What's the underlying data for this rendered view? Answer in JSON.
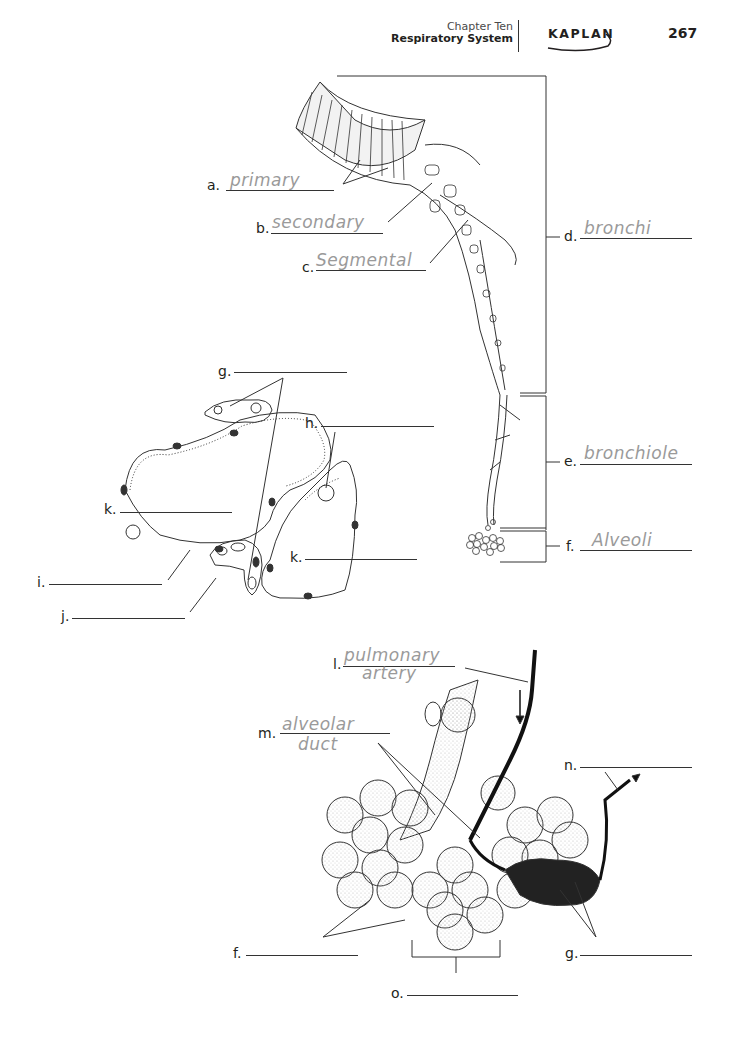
{
  "header": {
    "chapter": "Chapter Ten",
    "section": "Respiratory System",
    "brand": "KAPLAN",
    "page_number": "267"
  },
  "figure1": {
    "title": "Bronchial tree",
    "labels": [
      {
        "letter": "a.",
        "answer": "primary"
      },
      {
        "letter": "b.",
        "answer": "secondary"
      },
      {
        "letter": "c.",
        "answer": "Segmental"
      },
      {
        "letter": "d.",
        "answer": "bronchi"
      },
      {
        "letter": "e.",
        "answer": "bronchiole"
      },
      {
        "letter": "f.",
        "answer": "Alveoli"
      }
    ]
  },
  "figure2": {
    "title": "Alveolar cross section",
    "labels": [
      {
        "letter": "g.",
        "answer": ""
      },
      {
        "letter": "h.",
        "answer": ""
      },
      {
        "letter": "k.",
        "answer": ""
      },
      {
        "letter": "k.",
        "answer": ""
      },
      {
        "letter": "i.",
        "answer": ""
      },
      {
        "letter": "j.",
        "answer": ""
      }
    ]
  },
  "figure3": {
    "title": "Alveolar sacs with pulmonary vessels",
    "labels": [
      {
        "letter": "l.",
        "answer_line1": "pulmonary",
        "answer_line2": "artery"
      },
      {
        "letter": "m.",
        "answer_line1": "alveolar",
        "answer_line2": "duct"
      },
      {
        "letter": "n.",
        "answer": ""
      },
      {
        "letter": "f.",
        "answer": ""
      },
      {
        "letter": "g.",
        "answer": ""
      },
      {
        "letter": "o.",
        "answer": ""
      }
    ]
  },
  "colors": {
    "ink": "#231f20",
    "pencil": "#9a9a9a",
    "stipple": "#d9d9d9"
  }
}
